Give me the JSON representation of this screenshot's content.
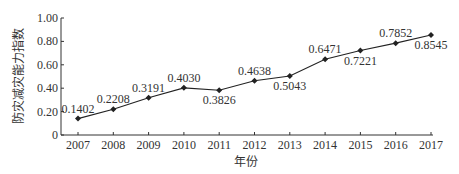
{
  "chart_data": {
    "type": "line",
    "title": "",
    "xlabel": "年份",
    "ylabel": "防灾减灾能力指数",
    "x": [
      "2007",
      "2008",
      "2009",
      "2010",
      "2011",
      "2012",
      "2013",
      "2014",
      "2015",
      "2016",
      "2017"
    ],
    "series": [
      {
        "name": "防灾减灾能力指数",
        "values": [
          0.1402,
          0.2208,
          0.3191,
          0.403,
          0.3826,
          0.4638,
          0.5043,
          0.6471,
          0.7221,
          0.7852,
          0.8545
        ],
        "labels": [
          "0.1402",
          "0.2208",
          "0.3191",
          "0.4030",
          "0.3826",
          "0.4638",
          "0.5043",
          "0.6471",
          "0.7221",
          "0.7852",
          "0.8545"
        ],
        "label_positions": [
          "above",
          "above",
          "above",
          "above",
          "below",
          "above",
          "below",
          "above",
          "below",
          "above",
          "below"
        ],
        "marker": "diamond",
        "color": "#222222"
      }
    ],
    "ylim": [
      0,
      1.0
    ],
    "yticks": [
      0,
      0.2,
      0.4,
      0.6,
      0.8,
      1.0
    ],
    "ytick_labels": [
      "0",
      "0.20",
      "0.40",
      "0.60",
      "0.80",
      "1.00"
    ],
    "grid": false,
    "legend": null
  }
}
